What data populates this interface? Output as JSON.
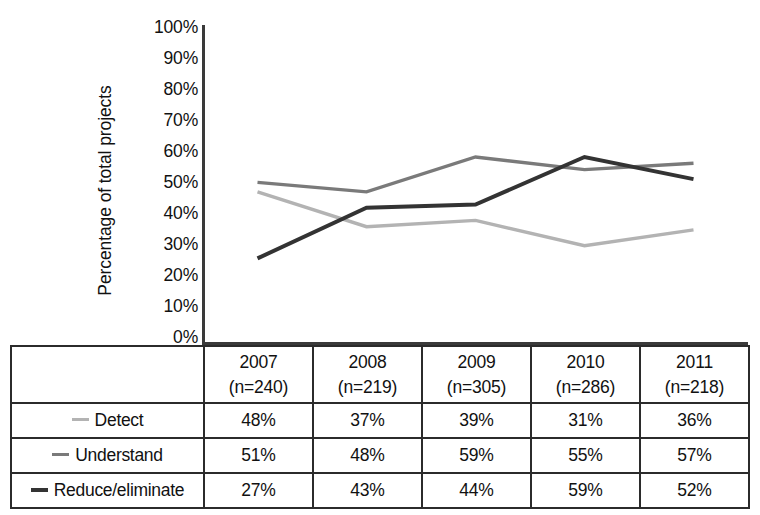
{
  "chart_data": {
    "type": "line",
    "title": "",
    "xlabel": "",
    "ylabel": "Percentage of total projects",
    "categories": [
      "2007",
      "2008",
      "2009",
      "2010",
      "2011"
    ],
    "category_sublabels": [
      "(n=240)",
      "(n=219)",
      "(n=305)",
      "(n=286)",
      "(n=218)"
    ],
    "sample_sizes": [
      240,
      219,
      305,
      286,
      218
    ],
    "ylim": [
      0,
      100
    ],
    "ytick_labels": [
      "100%",
      "90%",
      "80%",
      "70%",
      "60%",
      "50%",
      "40%",
      "30%",
      "20%",
      "10%",
      "0%"
    ],
    "ytick_values": [
      100,
      90,
      80,
      70,
      60,
      50,
      40,
      30,
      20,
      10,
      0
    ],
    "grid": false,
    "legend_position": "table-left-column",
    "series": [
      {
        "name": "Detect",
        "color": "#b3b3b3",
        "values": [
          48,
          37,
          39,
          31,
          36
        ],
        "value_labels": [
          "48%",
          "37%",
          "39%",
          "31%",
          "36%"
        ]
      },
      {
        "name": "Understand",
        "color": "#7a7a7a",
        "values": [
          51,
          48,
          59,
          55,
          57
        ],
        "value_labels": [
          "51%",
          "48%",
          "59%",
          "55%",
          "57%"
        ]
      },
      {
        "name": "Reduce/eliminate",
        "color": "#333333",
        "values": [
          27,
          43,
          44,
          59,
          52
        ],
        "value_labels": [
          "27%",
          "43%",
          "44%",
          "59%",
          "52%"
        ]
      }
    ]
  },
  "table": {
    "header_blank": "",
    "columns": [
      {
        "year": "2007",
        "n": "(n=240)"
      },
      {
        "year": "2008",
        "n": "(n=219)"
      },
      {
        "year": "2009",
        "n": "(n=305)"
      },
      {
        "year": "2010",
        "n": "(n=286)"
      },
      {
        "year": "2011",
        "n": "(n=218)"
      }
    ],
    "rows": [
      {
        "label": "Detect",
        "color": "#b3b3b3",
        "values": [
          "48%",
          "37%",
          "39%",
          "31%",
          "36%"
        ]
      },
      {
        "label": "Understand",
        "color": "#7a7a7a",
        "values": [
          "51%",
          "48%",
          "59%",
          "55%",
          "57%"
        ]
      },
      {
        "label": "Reduce/eliminate",
        "color": "#333333",
        "values": [
          "27%",
          "43%",
          "44%",
          "59%",
          "52%"
        ]
      }
    ]
  },
  "axis": {
    "title": "Percentage of total projects",
    "line_color": "#3a3a3a"
  }
}
